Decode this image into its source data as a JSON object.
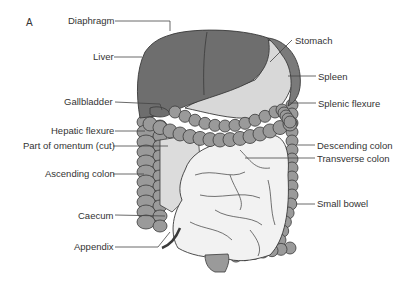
{
  "figure": {
    "panel_label": "A",
    "colors": {
      "liver": "#6e6e6e",
      "spleen": "#7a7a7a",
      "stomach": "#d8d8d8",
      "colon": "#9a9a9a",
      "small_bowel": "#f2f2f2",
      "omentum": "#dcdcdc",
      "outline": "#3a3a3a",
      "leader_line": "#444444",
      "text": "#333333"
    },
    "labels_left": [
      {
        "id": "diaphragm",
        "text": "Diaphragm"
      },
      {
        "id": "liver",
        "text": "Liver"
      },
      {
        "id": "gallbladder",
        "text": "Gallbladder"
      },
      {
        "id": "hepatic-flexure",
        "text": "Hepatic flexure"
      },
      {
        "id": "omentum",
        "text": "Part of omentum (cut)"
      },
      {
        "id": "ascending-colon",
        "text": "Ascending colon"
      },
      {
        "id": "caecum",
        "text": "Caecum"
      },
      {
        "id": "appendix",
        "text": "Appendix"
      }
    ],
    "labels_right": [
      {
        "id": "stomach",
        "text": "Stomach"
      },
      {
        "id": "spleen",
        "text": "Spleen"
      },
      {
        "id": "splenic-flexure",
        "text": "Splenic flexure"
      },
      {
        "id": "descending-colon",
        "text": "Descending colon"
      },
      {
        "id": "transverse-colon",
        "text": "Transverse colon"
      },
      {
        "id": "small-bowel",
        "text": "Small bowel"
      }
    ]
  }
}
